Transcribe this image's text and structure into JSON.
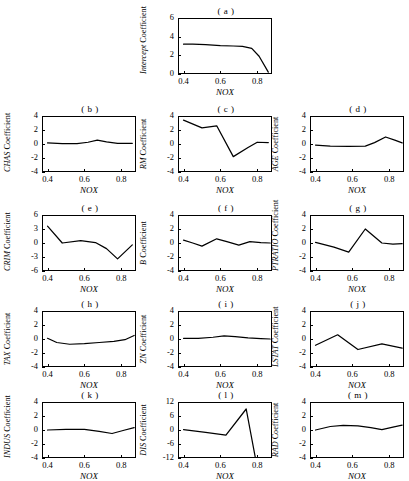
{
  "figure": {
    "xlabel": "NOX",
    "x_ticks": [
      "0.4",
      "0.6",
      "0.8"
    ],
    "x_tick_values": [
      0.4,
      0.6,
      0.8
    ],
    "xlim": [
      0.37,
      0.88
    ],
    "coefficient_word": "Coefficient"
  },
  "chart_data": [
    {
      "type": "line",
      "panel": "(a)",
      "title": "( a )",
      "ylabel": "Intercept Coefficient",
      "series_name": "Intercept",
      "xlabel": "NOX",
      "x": [
        0.4,
        0.45,
        0.52,
        0.6,
        0.67,
        0.72,
        0.77,
        0.81,
        0.86
      ],
      "values": [
        3.2,
        3.2,
        3.15,
        3.05,
        3.0,
        2.95,
        2.75,
        1.9,
        0.2
      ],
      "ylim": [
        0,
        6
      ],
      "y_ticks": [
        "0",
        "2",
        "4",
        "6"
      ],
      "y_tick_values": [
        0,
        2,
        4,
        6
      ],
      "xlim": [
        0.37,
        0.88
      ],
      "grid": false,
      "legend": "none"
    },
    {
      "type": "line",
      "panel": "(b)",
      "title": "( b )",
      "ylabel": "CHAS Coefficient",
      "series_name": "CHAS",
      "xlabel": "NOX",
      "x": [
        0.4,
        0.48,
        0.56,
        0.62,
        0.67,
        0.72,
        0.78,
        0.86
      ],
      "values": [
        0.15,
        0.05,
        0.05,
        0.25,
        0.55,
        0.3,
        0.1,
        0.1
      ],
      "ylim": [
        -4,
        4
      ],
      "y_ticks": [
        "-4",
        "-2",
        "0",
        "2",
        "4"
      ],
      "y_tick_values": [
        -4,
        -2,
        0,
        2,
        4
      ],
      "xlim": [
        0.37,
        0.88
      ],
      "grid": false,
      "legend": "none"
    },
    {
      "type": "line",
      "panel": "(c)",
      "title": "( c )",
      "ylabel": "RM Coefficient",
      "series_name": "RM",
      "xlabel": "NOX",
      "x": [
        0.4,
        0.5,
        0.58,
        0.67,
        0.75,
        0.8,
        0.86
      ],
      "values": [
        3.4,
        2.3,
        2.6,
        -1.8,
        -0.5,
        0.25,
        0.2
      ],
      "ylim": [
        -4,
        4
      ],
      "y_ticks": [
        "-4",
        "-2",
        "0",
        "2",
        "4"
      ],
      "y_tick_values": [
        -4,
        -2,
        0,
        2,
        4
      ],
      "xlim": [
        0.37,
        0.88
      ],
      "grid": false,
      "legend": "none"
    },
    {
      "type": "line",
      "panel": "(d)",
      "title": "( d )",
      "ylabel": "AGE Coefficient",
      "series_name": "AGE",
      "xlabel": "NOX",
      "x": [
        0.4,
        0.48,
        0.58,
        0.67,
        0.72,
        0.78,
        0.83,
        0.87
      ],
      "values": [
        -0.15,
        -0.3,
        -0.35,
        -0.3,
        0.2,
        1.0,
        0.55,
        0.15
      ],
      "ylim": [
        -4,
        4
      ],
      "y_ticks": [
        "-4",
        "-2",
        "0",
        "2",
        "4"
      ],
      "y_tick_values": [
        -4,
        -2,
        0,
        2,
        4
      ],
      "xlim": [
        0.37,
        0.88
      ],
      "grid": false,
      "legend": "none"
    },
    {
      "type": "line",
      "panel": "(e)",
      "title": "( e )",
      "ylabel": "CRIM Coefficient",
      "series_name": "CRIM",
      "xlabel": "NOX",
      "x": [
        0.4,
        0.48,
        0.58,
        0.66,
        0.72,
        0.78,
        0.86
      ],
      "values": [
        3.6,
        0.0,
        0.5,
        0.1,
        -1.2,
        -3.4,
        -0.4
      ],
      "ylim": [
        -6,
        6
      ],
      "y_ticks": [
        "-6",
        "-3",
        "0",
        "3",
        "6"
      ],
      "y_tick_values": [
        -6,
        -3,
        0,
        3,
        6
      ],
      "xlim": [
        0.37,
        0.88
      ],
      "grid": false,
      "legend": "none"
    },
    {
      "type": "line",
      "panel": "(f)",
      "title": "( f )",
      "ylabel": "B Coefficient",
      "series_name": "B",
      "xlabel": "NOX",
      "x": [
        0.4,
        0.45,
        0.5,
        0.58,
        0.64,
        0.7,
        0.76,
        0.82,
        0.87
      ],
      "values": [
        0.4,
        0.0,
        -0.45,
        0.6,
        0.15,
        -0.3,
        0.2,
        0.05,
        0.0
      ],
      "ylim": [
        -4,
        4
      ],
      "y_ticks": [
        "-4",
        "-2",
        "0",
        "2",
        "4"
      ],
      "y_tick_values": [
        -4,
        -2,
        0,
        2,
        4
      ],
      "xlim": [
        0.37,
        0.88
      ],
      "grid": false,
      "legend": "none"
    },
    {
      "type": "line",
      "panel": "(g)",
      "title": "( g )",
      "ylabel": "PTRATIO Coefficient",
      "series_name": "PTRATIO",
      "xlabel": "NOX",
      "x": [
        0.4,
        0.5,
        0.58,
        0.67,
        0.76,
        0.82,
        0.87
      ],
      "values": [
        0.1,
        -0.6,
        -1.3,
        2.0,
        0.0,
        -0.15,
        -0.1
      ],
      "ylim": [
        -4,
        4
      ],
      "y_ticks": [
        "-4",
        "-2",
        "0",
        "2",
        "4"
      ],
      "y_tick_values": [
        -4,
        -2,
        0,
        2,
        4
      ],
      "xlim": [
        0.37,
        0.88
      ],
      "grid": false,
      "legend": "none"
    },
    {
      "type": "line",
      "panel": "(h)",
      "title": "( h )",
      "ylabel": "TAX Coefficient",
      "series_name": "TAX",
      "xlabel": "NOX",
      "x": [
        0.4,
        0.45,
        0.52,
        0.6,
        0.68,
        0.76,
        0.82,
        0.87
      ],
      "values": [
        0.1,
        -0.5,
        -0.75,
        -0.65,
        -0.5,
        -0.35,
        -0.1,
        0.5
      ],
      "ylim": [
        -4,
        4
      ],
      "y_ticks": [
        "-4",
        "-2",
        "0",
        "2",
        "4"
      ],
      "y_tick_values": [
        -4,
        -2,
        0,
        2,
        4
      ],
      "xlim": [
        0.37,
        0.88
      ],
      "grid": false,
      "legend": "none"
    },
    {
      "type": "line",
      "panel": "(i)",
      "title": "( i )",
      "ylabel": "ZN Coefficient",
      "series_name": "ZN",
      "xlabel": "NOX",
      "x": [
        0.4,
        0.48,
        0.56,
        0.62,
        0.68,
        0.75,
        0.82,
        0.87
      ],
      "values": [
        0.1,
        0.1,
        0.25,
        0.45,
        0.35,
        0.15,
        0.05,
        0.0
      ],
      "ylim": [
        -4,
        4
      ],
      "y_ticks": [
        "-4",
        "-2",
        "0",
        "2",
        "4"
      ],
      "y_tick_values": [
        -4,
        -2,
        0,
        2,
        4
      ],
      "xlim": [
        0.37,
        0.88
      ],
      "grid": false,
      "legend": "none"
    },
    {
      "type": "line",
      "panel": "(j)",
      "title": "( j )",
      "ylabel": "LSTAT Coefficient",
      "series_name": "LSTAT",
      "xlabel": "NOX",
      "x": [
        0.4,
        0.52,
        0.63,
        0.76,
        0.87
      ],
      "values": [
        -0.9,
        0.6,
        -1.5,
        -0.7,
        -1.3
      ],
      "ylim": [
        -4,
        4
      ],
      "y_ticks": [
        "-4",
        "-2",
        "0",
        "2",
        "4"
      ],
      "y_tick_values": [
        -4,
        -2,
        0,
        2,
        4
      ],
      "xlim": [
        0.37,
        0.88
      ],
      "grid": false,
      "legend": "none"
    },
    {
      "type": "line",
      "panel": "(k)",
      "title": "( k )",
      "ylabel": "INDUS Coefficient",
      "series_name": "INDUS",
      "xlabel": "NOX",
      "x": [
        0.4,
        0.5,
        0.6,
        0.68,
        0.75,
        0.82,
        0.87
      ],
      "values": [
        0.0,
        0.1,
        0.1,
        -0.2,
        -0.5,
        0.0,
        0.35
      ],
      "ylim": [
        -4,
        4
      ],
      "y_ticks": [
        "-4",
        "-2",
        "0",
        "2",
        "4"
      ],
      "y_tick_values": [
        -4,
        -2,
        0,
        2,
        4
      ],
      "xlim": [
        0.37,
        0.88
      ],
      "grid": false,
      "legend": "none"
    },
    {
      "type": "line",
      "panel": "(l)",
      "title": "( l )",
      "ylabel": "DIS Coefficient",
      "series_name": "DIS",
      "xlabel": "NOX",
      "x": [
        0.4,
        0.52,
        0.63,
        0.74,
        0.79,
        0.8
      ],
      "values": [
        0.2,
        -1.0,
        -2.2,
        9.0,
        -12.0,
        -13.5
      ],
      "ylim": [
        -12,
        12
      ],
      "y_ticks": [
        "-12",
        "-6",
        "0",
        "6",
        "12"
      ],
      "y_tick_values": [
        -12,
        -6,
        0,
        6,
        12
      ],
      "xlim": [
        0.37,
        0.88
      ],
      "grid": false,
      "legend": "none"
    },
    {
      "type": "line",
      "panel": "(m)",
      "title": "( m )",
      "ylabel": "RAD Coefficient",
      "series_name": "RAD",
      "xlabel": "NOX",
      "x": [
        0.4,
        0.48,
        0.55,
        0.63,
        0.7,
        0.76,
        0.82,
        0.87
      ],
      "values": [
        0.0,
        0.5,
        0.65,
        0.6,
        0.35,
        0.05,
        0.4,
        0.7
      ],
      "ylim": [
        -4,
        4
      ],
      "y_ticks": [
        "-4",
        "-2",
        "0",
        "2",
        "4"
      ],
      "y_tick_values": [
        -4,
        -2,
        0,
        2,
        4
      ],
      "xlim": [
        0.37,
        0.88
      ],
      "grid": false,
      "legend": "none"
    }
  ],
  "layout": {
    "panel_positions": [
      {
        "id": "a",
        "left": 140,
        "top": 6
      },
      {
        "id": "b",
        "left": 4,
        "top": 104
      },
      {
        "id": "c",
        "left": 140,
        "top": 104
      },
      {
        "id": "d",
        "left": 272,
        "top": 104
      },
      {
        "id": "e",
        "left": 4,
        "top": 203
      },
      {
        "id": "f",
        "left": 140,
        "top": 203
      },
      {
        "id": "g",
        "left": 272,
        "top": 203
      },
      {
        "id": "h",
        "left": 4,
        "top": 299
      },
      {
        "id": "i",
        "left": 140,
        "top": 299
      },
      {
        "id": "j",
        "left": 272,
        "top": 299
      },
      {
        "id": "k",
        "left": 4,
        "top": 390
      },
      {
        "id": "l",
        "left": 140,
        "top": 390
      },
      {
        "id": "m",
        "left": 272,
        "top": 390
      }
    ]
  }
}
